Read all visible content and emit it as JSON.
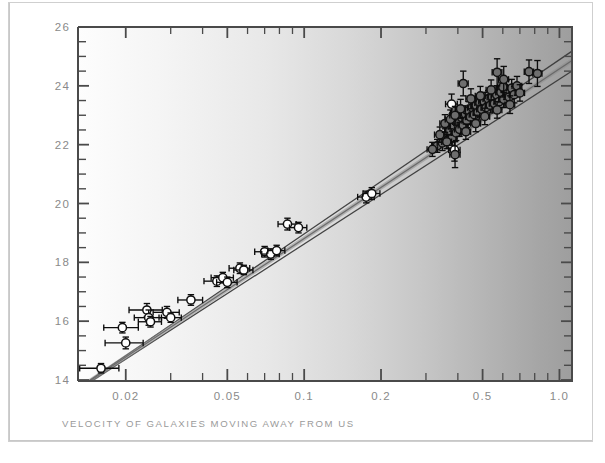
{
  "figure": {
    "kind": "scientific-plot",
    "background": "#ffffff",
    "frame_color": "#c8c8c8"
  },
  "axes": {
    "x_label": "VELOCITY OF GALAXIES MOVING AWAY FROM US",
    "y_label": "DISTANCE OF GALAXIES FROM US",
    "x_tick_labels": [
      "0.02",
      "0.05",
      "0.1",
      "0.2",
      "0.5",
      "1.0"
    ],
    "y_tick_labels": [
      "14",
      "16",
      "18",
      "20",
      "22",
      "24",
      "26"
    ],
    "label_color": "#9a9a9a",
    "tick_color": "#8a8a8a",
    "frame_color": "#4a4a4a"
  },
  "chart_data": {
    "type": "scatter",
    "title": "",
    "xlabel": "VELOCITY OF GALAXIES MOVING AWAY FROM US",
    "ylabel": "DISTANCE OF GALAXIES FROM US",
    "xscale": "log",
    "yscale": "linear",
    "xlim": [
      0.013,
      1.12
    ],
    "ylim": [
      14,
      26
    ],
    "xticks": [
      0.02,
      0.05,
      0.1,
      0.2,
      0.5,
      1.0
    ],
    "xticklabels": [
      "0.02",
      "0.05",
      "0.1",
      "0.2",
      "0.5",
      "1.0"
    ],
    "yticks": [
      14,
      16,
      18,
      20,
      22,
      24,
      26
    ],
    "yticklabels": [
      "14",
      "16",
      "18",
      "20",
      "22",
      "24",
      "26"
    ],
    "y_minor_tick_step": 0.5,
    "grid": false,
    "legend": null,
    "marker": {
      "shape": "circle",
      "near_fill": "#ffffff",
      "far_fill": "#6e6e6e",
      "edge": "#111111",
      "error_bars": "both"
    },
    "series": [
      {
        "name": "nearby galaxies (open circles)",
        "fill": "#ffffff",
        "points": [
          {
            "x": 0.016,
            "y": 14.4,
            "xerr": 0.0028,
            "yerr": 0.16
          },
          {
            "x": 0.0194,
            "y": 15.78,
            "xerr": 0.003,
            "yerr": 0.18
          },
          {
            "x": 0.02,
            "y": 15.26,
            "xerr": 0.0034,
            "yerr": 0.2
          },
          {
            "x": 0.0242,
            "y": 16.38,
            "xerr": 0.0036,
            "yerr": 0.22
          },
          {
            "x": 0.0246,
            "y": 16.12,
            "xerr": 0.003,
            "yerr": 0.26
          },
          {
            "x": 0.025,
            "y": 15.98,
            "xerr": 0.0026,
            "yerr": 0.18
          },
          {
            "x": 0.029,
            "y": 16.3,
            "xerr": 0.0034,
            "yerr": 0.2
          },
          {
            "x": 0.03,
            "y": 16.12,
            "xerr": 0.003,
            "yerr": 0.16
          },
          {
            "x": 0.036,
            "y": 16.72,
            "xerr": 0.004,
            "yerr": 0.18
          },
          {
            "x": 0.0455,
            "y": 17.36,
            "xerr": 0.005,
            "yerr": 0.18
          },
          {
            "x": 0.048,
            "y": 17.48,
            "xerr": 0.0048,
            "yerr": 0.18
          },
          {
            "x": 0.05,
            "y": 17.32,
            "xerr": 0.0046,
            "yerr": 0.18
          },
          {
            "x": 0.056,
            "y": 17.8,
            "xerr": 0.0052,
            "yerr": 0.18
          },
          {
            "x": 0.058,
            "y": 17.74,
            "xerr": 0.005,
            "yerr": 0.16
          },
          {
            "x": 0.07,
            "y": 18.36,
            "xerr": 0.006,
            "yerr": 0.18
          },
          {
            "x": 0.074,
            "y": 18.28,
            "xerr": 0.0058,
            "yerr": 0.18
          },
          {
            "x": 0.078,
            "y": 18.4,
            "xerr": 0.006,
            "yerr": 0.18
          },
          {
            "x": 0.086,
            "y": 19.3,
            "xerr": 0.007,
            "yerr": 0.2
          },
          {
            "x": 0.095,
            "y": 19.18,
            "xerr": 0.0074,
            "yerr": 0.18
          },
          {
            "x": 0.175,
            "y": 20.22,
            "xerr": 0.013,
            "yerr": 0.2
          },
          {
            "x": 0.184,
            "y": 20.34,
            "xerr": 0.014,
            "yerr": 0.2
          },
          {
            "x": 0.378,
            "y": 23.38,
            "xerr": 0.02,
            "yerr": 0.34
          },
          {
            "x": 0.405,
            "y": 22.72,
            "xerr": 0.021,
            "yerr": 0.3
          },
          {
            "x": 0.388,
            "y": 21.82,
            "xerr": 0.02,
            "yerr": 0.38
          }
        ]
      },
      {
        "name": "distant supernovae (filled circles)",
        "fill": "#6e6e6e",
        "points": [
          {
            "x": 0.332,
            "y": 21.96,
            "xerr": 0.016,
            "yerr": 0.22
          },
          {
            "x": 0.348,
            "y": 22.06,
            "xerr": 0.016,
            "yerr": 0.26
          },
          {
            "x": 0.356,
            "y": 22.3,
            "xerr": 0.016,
            "yerr": 0.24
          },
          {
            "x": 0.366,
            "y": 22.16,
            "xerr": 0.016,
            "yerr": 0.28
          },
          {
            "x": 0.372,
            "y": 22.48,
            "xerr": 0.017,
            "yerr": 0.26
          },
          {
            "x": 0.38,
            "y": 22.22,
            "xerr": 0.017,
            "yerr": 0.24
          },
          {
            "x": 0.386,
            "y": 22.62,
            "xerr": 0.017,
            "yerr": 0.3
          },
          {
            "x": 0.394,
            "y": 22.4,
            "xerr": 0.018,
            "yerr": 0.26
          },
          {
            "x": 0.4,
            "y": 22.78,
            "xerr": 0.018,
            "yerr": 0.28
          },
          {
            "x": 0.406,
            "y": 22.52,
            "xerr": 0.018,
            "yerr": 0.24
          },
          {
            "x": 0.414,
            "y": 22.92,
            "xerr": 0.018,
            "yerr": 0.3
          },
          {
            "x": 0.42,
            "y": 22.66,
            "xerr": 0.019,
            "yerr": 0.26
          },
          {
            "x": 0.428,
            "y": 23.04,
            "xerr": 0.019,
            "yerr": 0.28
          },
          {
            "x": 0.434,
            "y": 22.82,
            "xerr": 0.019,
            "yerr": 0.24
          },
          {
            "x": 0.442,
            "y": 23.16,
            "xerr": 0.02,
            "yerr": 0.3
          },
          {
            "x": 0.448,
            "y": 22.94,
            "xerr": 0.02,
            "yerr": 0.26
          },
          {
            "x": 0.456,
            "y": 23.26,
            "xerr": 0.02,
            "yerr": 0.28
          },
          {
            "x": 0.464,
            "y": 23.02,
            "xerr": 0.021,
            "yerr": 0.24
          },
          {
            "x": 0.472,
            "y": 23.34,
            "xerr": 0.021,
            "yerr": 0.3
          },
          {
            "x": 0.48,
            "y": 23.1,
            "xerr": 0.021,
            "yerr": 0.26
          },
          {
            "x": 0.488,
            "y": 23.42,
            "xerr": 0.022,
            "yerr": 0.28
          },
          {
            "x": 0.496,
            "y": 23.2,
            "xerr": 0.022,
            "yerr": 0.26
          },
          {
            "x": 0.506,
            "y": 23.48,
            "xerr": 0.023,
            "yerr": 0.3
          },
          {
            "x": 0.516,
            "y": 23.26,
            "xerr": 0.023,
            "yerr": 0.26
          },
          {
            "x": 0.526,
            "y": 23.56,
            "xerr": 0.024,
            "yerr": 0.28
          },
          {
            "x": 0.536,
            "y": 23.34,
            "xerr": 0.024,
            "yerr": 0.26
          },
          {
            "x": 0.546,
            "y": 23.62,
            "xerr": 0.025,
            "yerr": 0.3
          },
          {
            "x": 0.556,
            "y": 23.4,
            "xerr": 0.025,
            "yerr": 0.26
          },
          {
            "x": 0.568,
            "y": 23.7,
            "xerr": 0.026,
            "yerr": 0.3
          },
          {
            "x": 0.58,
            "y": 23.46,
            "xerr": 0.026,
            "yerr": 0.26
          },
          {
            "x": 0.59,
            "y": 23.78,
            "xerr": 0.027,
            "yerr": 0.32
          },
          {
            "x": 0.605,
            "y": 23.54,
            "xerr": 0.027,
            "yerr": 0.28
          },
          {
            "x": 0.62,
            "y": 23.86,
            "xerr": 0.028,
            "yerr": 0.32
          },
          {
            "x": 0.635,
            "y": 23.62,
            "xerr": 0.028,
            "yerr": 0.28
          },
          {
            "x": 0.65,
            "y": 23.92,
            "xerr": 0.029,
            "yerr": 0.3
          },
          {
            "x": 0.665,
            "y": 23.7,
            "xerr": 0.029,
            "yerr": 0.28
          },
          {
            "x": 0.682,
            "y": 24.0,
            "xerr": 0.03,
            "yerr": 0.32
          },
          {
            "x": 0.7,
            "y": 23.76,
            "xerr": 0.03,
            "yerr": 0.28
          },
          {
            "x": 0.318,
            "y": 21.84,
            "xerr": 0.015,
            "yerr": 0.24
          },
          {
            "x": 0.34,
            "y": 22.34,
            "xerr": 0.016,
            "yerr": 0.26
          },
          {
            "x": 0.356,
            "y": 22.72,
            "xerr": 0.016,
            "yerr": 0.3
          },
          {
            "x": 0.362,
            "y": 22.1,
            "xerr": 0.016,
            "yerr": 0.24
          },
          {
            "x": 0.374,
            "y": 22.86,
            "xerr": 0.017,
            "yerr": 0.32
          },
          {
            "x": 0.39,
            "y": 23.0,
            "xerr": 0.018,
            "yerr": 0.3
          },
          {
            "x": 0.41,
            "y": 23.22,
            "xerr": 0.018,
            "yerr": 0.32
          },
          {
            "x": 0.43,
            "y": 22.44,
            "xerr": 0.019,
            "yerr": 0.26
          },
          {
            "x": 0.45,
            "y": 23.56,
            "xerr": 0.02,
            "yerr": 0.34
          },
          {
            "x": 0.47,
            "y": 22.72,
            "xerr": 0.021,
            "yerr": 0.28
          },
          {
            "x": 0.49,
            "y": 23.66,
            "xerr": 0.022,
            "yerr": 0.32
          },
          {
            "x": 0.51,
            "y": 22.96,
            "xerr": 0.023,
            "yerr": 0.28
          },
          {
            "x": 0.54,
            "y": 23.86,
            "xerr": 0.024,
            "yerr": 0.34
          },
          {
            "x": 0.57,
            "y": 23.18,
            "xerr": 0.025,
            "yerr": 0.28
          },
          {
            "x": 0.6,
            "y": 23.96,
            "xerr": 0.027,
            "yerr": 0.34
          },
          {
            "x": 0.64,
            "y": 23.36,
            "xerr": 0.028,
            "yerr": 0.3
          },
          {
            "x": 0.42,
            "y": 24.08,
            "xerr": 0.019,
            "yerr": 0.42
          },
          {
            "x": 0.57,
            "y": 24.46,
            "xerr": 0.025,
            "yerr": 0.46
          },
          {
            "x": 0.605,
            "y": 24.22,
            "xerr": 0.027,
            "yerr": 0.44
          },
          {
            "x": 0.76,
            "y": 24.48,
            "xerr": 0.032,
            "yerr": 0.4
          },
          {
            "x": 0.82,
            "y": 24.42,
            "xerr": 0.034,
            "yerr": 0.44
          },
          {
            "x": 0.39,
            "y": 21.66,
            "xerr": 0.018,
            "yerr": 0.44
          }
        ]
      }
    ],
    "fit_lines": [
      {
        "name": "model-upper",
        "color": "#3a3a3a",
        "x0": 0.013,
        "y0": 13.72,
        "x1": 1.12,
        "y1": 25.18
      },
      {
        "name": "model-middle",
        "color": "#3a3a3a",
        "x0": 0.013,
        "y0": 13.7,
        "x1": 1.12,
        "y1": 24.86
      },
      {
        "name": "model-lower",
        "color": "#3a3a3a",
        "x0": 0.013,
        "y0": 13.66,
        "x1": 1.12,
        "y1": 24.5
      },
      {
        "name": "model-band",
        "color": "#8c8c8c",
        "x0": 0.013,
        "y0": 13.7,
        "x1": 1.12,
        "y1": 24.86
      }
    ]
  }
}
